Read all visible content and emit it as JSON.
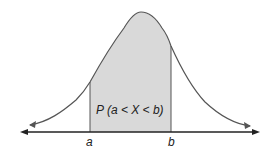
{
  "diagram": {
    "region_label": "P (a < X < b)",
    "left_bound_label": "a",
    "right_bound_label": "b",
    "colors": {
      "curve": "#555555",
      "shade": "#d9d9d9",
      "axis": "#222222"
    }
  }
}
